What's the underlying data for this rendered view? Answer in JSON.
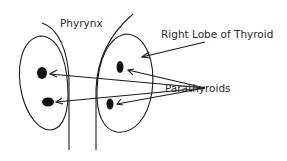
{
  "diagram": {
    "labels": {
      "pharynx": "Phyrynx",
      "right_lobe": "Right Lobe of Thyroid",
      "parathyroids": "Parathyroids"
    },
    "colors": {
      "stroke": "#1a1a1a",
      "text": "#2a2a2a",
      "background": "#ffffff"
    }
  }
}
